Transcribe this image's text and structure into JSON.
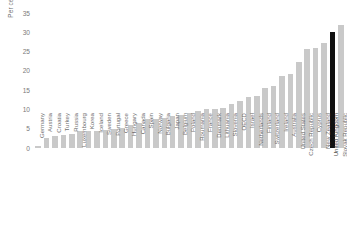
{
  "chart_data": {
    "type": "bar",
    "title": "",
    "xlabel": "",
    "ylabel": "Per cent of average wage",
    "ylim": [
      0,
      35
    ],
    "yticks": [
      0,
      5,
      10,
      15,
      20,
      25,
      30,
      35
    ],
    "grid": false,
    "legend": null,
    "highlight_category": "United Kingdom",
    "colors": {
      "bar": "#c9c9c9",
      "highlight_bar": "#111111",
      "text": "#6f6f6f"
    },
    "categories": [
      "Germany",
      "Austria",
      "Croatia",
      "Turkey",
      "Russia",
      "Luxembourg",
      "Korea",
      "Iceland",
      "Sweden",
      "Portugal",
      "Greece",
      "Hungary",
      "Canada",
      "Spain",
      "Norway",
      "Bulgaria",
      "Japan",
      "Belgium",
      "Poland",
      "Roumania",
      "France",
      "Denmark",
      "Lithuania",
      "Slovenia",
      "OECD",
      "Israel",
      "Netherlands",
      "Finland",
      "Switzerland",
      "Ireland",
      "Australia",
      "United States",
      "Czech Republic",
      "Cyprus",
      "New Zealand",
      "United Kingdom",
      "Slovak Republic"
    ],
    "values": [
      0.5,
      2.6,
      3.1,
      3.3,
      3.6,
      4.3,
      4.4,
      4.5,
      4.6,
      4.9,
      5.3,
      5.9,
      6.6,
      7.4,
      7.6,
      7.8,
      8.3,
      8.6,
      9.0,
      9.7,
      10.0,
      10.2,
      10.5,
      11.4,
      12.3,
      13.2,
      13.4,
      15.6,
      16.0,
      18.7,
      19.3,
      22.4,
      25.8,
      26.0,
      27.3,
      30.0,
      32.0
    ]
  }
}
